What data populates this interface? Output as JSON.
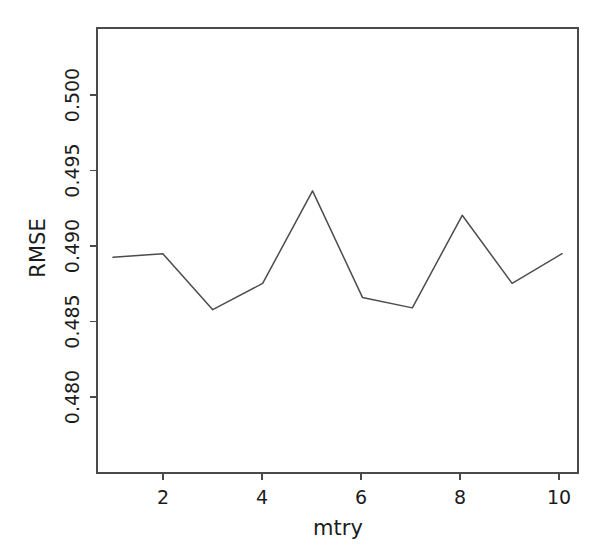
{
  "chart_data": {
    "type": "line",
    "title": "",
    "subtitle": "",
    "xlabel": "mtry",
    "ylabel": "RMSE",
    "x": [
      1,
      2,
      3,
      4,
      5,
      6,
      7,
      8,
      9,
      10
    ],
    "values": [
      0.4892,
      0.4894,
      0.4862,
      0.4877,
      0.493,
      0.4869,
      0.4863,
      0.4916,
      0.4877,
      0.4894
    ],
    "series": [
      {
        "name": "RMSE",
        "values": [
          0.4892,
          0.4894,
          0.4862,
          0.4877,
          0.493,
          0.4869,
          0.4863,
          0.4916,
          0.4877,
          0.4894
        ]
      }
    ],
    "xlim": [
      0.68,
      10.32
    ],
    "ylim": [
      0.47685,
      0.50232
    ],
    "xticks": [
      2,
      4,
      6,
      8,
      10
    ],
    "xtick_labels": [
      "2",
      "4",
      "6",
      "8",
      "10"
    ],
    "yticks": [
      0.48,
      0.485,
      0.49,
      0.495,
      0.5
    ],
    "ytick_labels": [
      "0.480",
      "0.485",
      "0.490",
      "0.495",
      "0.500"
    ],
    "grid": false,
    "legend": false,
    "legend_position": "none",
    "line_color": "#4c4c4c",
    "axis_color": "#4a4a4a",
    "background_color": "#ffffff",
    "ylabel_rotation": 90,
    "ytick_label_rotation": 90,
    "markers": false,
    "box": true,
    "annotations": []
  },
  "axes": {
    "y_axis_title": "RMSE",
    "x_axis_title": "mtry"
  }
}
